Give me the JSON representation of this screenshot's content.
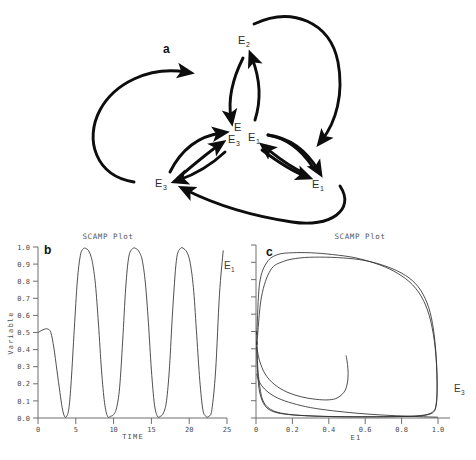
{
  "figure": {
    "panels": [
      {
        "letter": "a",
        "kind": "diagram"
      },
      {
        "letter": "b",
        "kind": "timeseries"
      },
      {
        "letter": "c",
        "kind": "phase-portrait"
      }
    ]
  },
  "panel_a": {
    "letter": "a",
    "title": "",
    "nodes": [
      {
        "id": "e2-top",
        "base": "E",
        "sub": "2",
        "x": 247,
        "y": 40
      },
      {
        "id": "e-center",
        "base": "E",
        "sub": "",
        "x": 238,
        "y": 128
      },
      {
        "id": "e3-center",
        "base": "E",
        "sub": "3",
        "x": 234,
        "y": 140
      },
      {
        "id": "e1-center",
        "base": "E",
        "sub": "1",
        "x": 254,
        "y": 138
      },
      {
        "id": "e3-left",
        "base": "E",
        "sub": "3",
        "x": 161,
        "y": 183
      },
      {
        "id": "e1-right",
        "base": "E",
        "sub": "1",
        "x": 318,
        "y": 184
      }
    ]
  },
  "panel_b": {
    "letter": "b",
    "plot_title": "SCAMP Plot",
    "xlabel": "TIME",
    "ylabel": "Variable",
    "curve_label": {
      "base": "E",
      "sub": "1"
    },
    "xticks": [
      "0",
      "5",
      "10",
      "15",
      "20",
      "25"
    ],
    "yticks": [
      "0.0",
      "0.1",
      "0.2",
      "0.3",
      "0.4",
      "0.5",
      "0.6",
      "0.7",
      "0.8",
      "0.9",
      "1.0"
    ],
    "xlim": [
      0,
      25
    ],
    "ylim": [
      0,
      1.0
    ]
  },
  "panel_c": {
    "letter": "c",
    "plot_title": "SCAMP Plot",
    "xlabel": "E1",
    "ylabel": "",
    "curve_label": {
      "base": "E",
      "sub": "3"
    },
    "xticks": [
      "0",
      "0.2",
      "0.4",
      "0.6",
      "0.8",
      "1.0"
    ],
    "xlim": [
      0,
      1.0
    ],
    "ylim": [
      0,
      1.0
    ]
  },
  "chart_data": [
    {
      "id": "panel_b",
      "type": "line",
      "title": "SCAMP Plot",
      "xlabel": "TIME",
      "ylabel": "Variable",
      "xlim": [
        0,
        25
      ],
      "ylim": [
        0,
        1.0
      ],
      "grid": false,
      "legend": "none",
      "annotations": [
        {
          "text": "E1",
          "x": 24.6,
          "y": 0.9
        }
      ],
      "series": [
        {
          "name": "E1",
          "comment": "relaxation-oscillator limit cycle, period about 6.3 time units",
          "x": [
            0.0,
            0.4,
            0.9,
            1.3,
            1.7,
            2.1,
            2.5,
            2.9,
            3.2,
            3.5,
            3.8,
            4.1,
            4.4,
            4.8,
            5.2,
            5.6,
            6.0,
            6.4,
            6.8,
            7.2,
            7.6,
            8.0,
            8.4,
            8.8,
            9.2,
            9.6,
            10.0,
            10.4,
            10.8,
            11.2,
            11.6,
            12.0,
            12.5,
            13.0,
            13.4,
            13.8,
            14.2,
            14.6,
            15.0,
            15.4,
            15.8,
            16.2,
            16.6,
            17.0,
            17.4,
            17.8,
            18.3,
            18.8,
            19.3,
            19.8,
            20.2,
            20.6,
            21.0,
            21.4,
            21.8,
            22.2,
            22.6,
            23.0,
            23.5,
            24.0,
            24.5
          ],
          "y": [
            0.5,
            0.51,
            0.52,
            0.52,
            0.5,
            0.41,
            0.28,
            0.15,
            0.06,
            0.01,
            0.01,
            0.06,
            0.22,
            0.52,
            0.8,
            0.95,
            0.99,
            0.99,
            0.97,
            0.91,
            0.78,
            0.55,
            0.28,
            0.09,
            0.01,
            0.01,
            0.02,
            0.06,
            0.18,
            0.45,
            0.76,
            0.94,
            0.99,
            0.99,
            0.97,
            0.92,
            0.79,
            0.56,
            0.28,
            0.08,
            0.01,
            0.01,
            0.03,
            0.1,
            0.3,
            0.62,
            0.92,
            0.99,
            0.99,
            0.96,
            0.89,
            0.74,
            0.48,
            0.22,
            0.05,
            0.01,
            0.01,
            0.05,
            0.28,
            0.72,
            0.98
          ]
        }
      ]
    },
    {
      "id": "panel_c",
      "type": "line",
      "title": "SCAMP Plot",
      "xlabel": "E1",
      "ylabel": "E3",
      "xlim": [
        0,
        1.0
      ],
      "ylim": [
        0,
        1.0
      ],
      "grid": false,
      "legend": "none",
      "annotations": [
        {
          "text": "E3",
          "x": 1.0,
          "y": 0.17
        }
      ],
      "series": [
        {
          "name": "limit-cycle-outer",
          "comment": "closed outer loop of the phase portrait in the E1-E3 plane",
          "x": [
            0.005,
            0.02,
            0.06,
            0.12,
            0.2,
            0.3,
            0.42,
            0.55,
            0.68,
            0.78,
            0.86,
            0.92,
            0.96,
            0.985,
            0.995,
            0.99,
            0.97,
            0.9,
            0.78,
            0.62,
            0.45,
            0.3,
            0.18,
            0.1,
            0.05,
            0.02,
            0.008,
            0.004,
            0.004,
            0.005
          ],
          "y": [
            0.5,
            0.78,
            0.9,
            0.945,
            0.955,
            0.955,
            0.945,
            0.925,
            0.885,
            0.835,
            0.77,
            0.68,
            0.56,
            0.4,
            0.22,
            0.08,
            0.03,
            0.012,
            0.008,
            0.007,
            0.008,
            0.012,
            0.02,
            0.035,
            0.07,
            0.15,
            0.28,
            0.4,
            0.46,
            0.5
          ]
        },
        {
          "name": "limit-cycle-second",
          "comment": "second nearby loop traced slightly inside the first",
          "x": [
            0.006,
            0.03,
            0.08,
            0.15,
            0.24,
            0.35,
            0.48,
            0.6,
            0.72,
            0.82,
            0.89,
            0.94,
            0.97,
            0.988,
            0.995,
            0.99,
            0.96,
            0.88,
            0.74,
            0.58,
            0.42,
            0.28,
            0.16,
            0.08,
            0.035,
            0.014,
            0.007,
            0.006
          ],
          "y": [
            0.44,
            0.7,
            0.855,
            0.905,
            0.925,
            0.93,
            0.925,
            0.91,
            0.875,
            0.825,
            0.76,
            0.665,
            0.545,
            0.385,
            0.21,
            0.075,
            0.028,
            0.012,
            0.008,
            0.007,
            0.008,
            0.013,
            0.024,
            0.05,
            0.11,
            0.24,
            0.36,
            0.44
          ]
        },
        {
          "name": "transient-spiral",
          "comment": "inward transient starting near the E3 axis, spiralling to an inner turning point near (0.50, 0.36)",
          "x": [
            0.004,
            0.02,
            0.05,
            0.1,
            0.17,
            0.25,
            0.33,
            0.4,
            0.45,
            0.49,
            0.505,
            0.505,
            0.5,
            0.495
          ],
          "y": [
            0.41,
            0.33,
            0.255,
            0.195,
            0.15,
            0.122,
            0.108,
            0.105,
            0.118,
            0.16,
            0.225,
            0.285,
            0.33,
            0.362
          ]
        },
        {
          "name": "lower-transient",
          "comment": "lower transient branch sweeping from the E3 axis toward E1 = 1",
          "x": [
            0.004,
            0.02,
            0.06,
            0.12,
            0.2,
            0.3,
            0.42,
            0.55,
            0.68,
            0.8,
            0.9,
            0.96,
            0.99,
            1.0
          ],
          "y": [
            0.255,
            0.205,
            0.155,
            0.115,
            0.085,
            0.06,
            0.042,
            0.028,
            0.018,
            0.012,
            0.008,
            0.006,
            0.005,
            0.005
          ]
        }
      ]
    }
  ]
}
